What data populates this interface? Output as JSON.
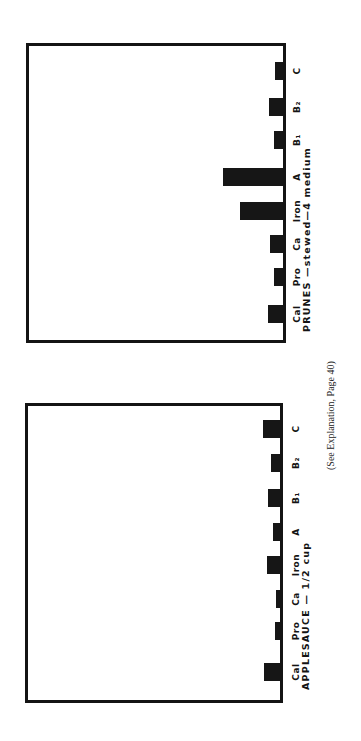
{
  "caption": "(See Explanation, Page 40)",
  "chart_data": [
    {
      "type": "bar",
      "orientation": "rotated-90",
      "title": "PRUNES —stewed—4 medium",
      "categories": [
        "Cal",
        "Pro",
        "Ca",
        "Iron",
        "A",
        "B1",
        "B2",
        "C"
      ],
      "category_labels": [
        "Cal",
        "Pro",
        "Ca",
        "Iron",
        "A",
        "B₁",
        "B₂",
        "C"
      ],
      "values": [
        15,
        9,
        13,
        43,
        60,
        9,
        14,
        8
      ],
      "value_units": "relative bar length (px, unlabeled axis)",
      "xlabel": "",
      "ylabel": "",
      "grid": false,
      "legend": false
    },
    {
      "type": "bar",
      "orientation": "rotated-90",
      "title": "APPLESAUCE — 1/2 cup",
      "categories": [
        "Cal",
        "Pro",
        "Ca",
        "Iron",
        "A",
        "B1",
        "B2",
        "C"
      ],
      "category_labels": [
        "Cal",
        "Pro",
        "Ca",
        "Iron",
        "A",
        "B₁",
        "B₂",
        "C"
      ],
      "values": [
        16,
        5,
        4,
        13,
        7,
        12,
        9,
        17
      ],
      "value_units": "relative bar length (px, unlabeled axis)",
      "xlabel": "",
      "ylabel": "",
      "grid": false,
      "legend": false
    }
  ],
  "colors": {
    "bar": "#161616",
    "frame": "#141414",
    "background": "#ffffff"
  }
}
